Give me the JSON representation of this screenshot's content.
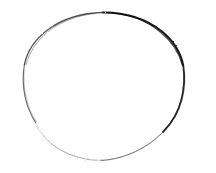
{
  "document": {
    "title": "Hand-drawn circle",
    "kind": "scanned-sketch",
    "width": 216,
    "height": 173,
    "background_color": "#ffffff",
    "caption": ""
  },
  "artwork": {
    "name": "circle-outline",
    "description": "Single rough hand-drawn circle outline on white paper",
    "stroke_color": "#1a1a1a",
    "faint_stroke_color": "#9a9a9a",
    "mid_stroke_color": "#545454",
    "center_x": 103.5,
    "center_y": 89.0,
    "radius_x": 80.0,
    "radius_y": 77.0,
    "bounds": {
      "left": 23,
      "top": 12,
      "right": 184,
      "bottom": 166
    },
    "stroke_min_width": 0.6,
    "stroke_max_width": 2.2,
    "segments": [
      {
        "name": "top-right-arc",
        "weight": "heavy",
        "opacity": 0.96,
        "stroke_width": 2.0,
        "color": "#111111"
      },
      {
        "name": "right-arc",
        "weight": "heavy",
        "opacity": 0.92,
        "stroke_width": 1.8,
        "color": "#1c1c1c"
      },
      {
        "name": "top-left-arc",
        "weight": "medium",
        "opacity": 0.8,
        "stroke_width": 1.3,
        "color": "#2b2b2b"
      },
      {
        "name": "left-arc",
        "weight": "medium",
        "opacity": 0.72,
        "stroke_width": 1.1,
        "color": "#3a3a3a"
      },
      {
        "name": "bottom-right-arc",
        "weight": "light",
        "opacity": 0.62,
        "stroke_width": 1.0,
        "color": "#4a4a4a"
      },
      {
        "name": "bottom-arc",
        "weight": "faint",
        "opacity": 0.42,
        "stroke_width": 0.9,
        "color": "#6e6e6e"
      },
      {
        "name": "bottom-left-arc",
        "weight": "very-faint",
        "opacity": 0.3,
        "stroke_width": 0.8,
        "color": "#8d8d8d"
      }
    ]
  }
}
